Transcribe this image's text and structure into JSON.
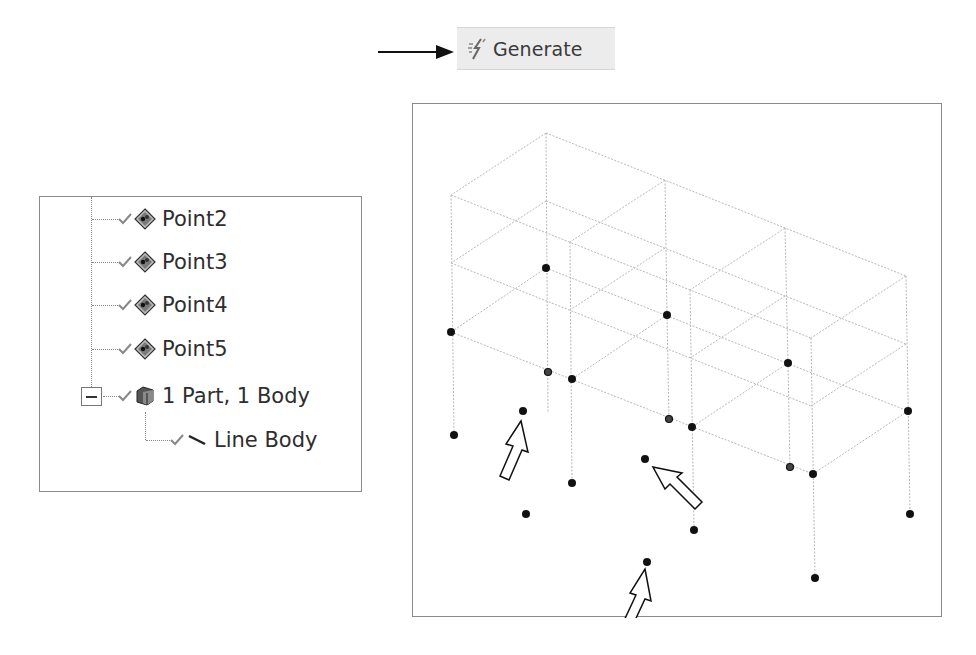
{
  "toolbar": {
    "generate_label": "Generate",
    "generate_icon": "generate-lightning-icon"
  },
  "annotation": {
    "pointer_arrow": "right-arrow-icon"
  },
  "tree": {
    "items": [
      {
        "label": "Point2",
        "icon": "point-feature-icon",
        "status": "check-icon"
      },
      {
        "label": "Point3",
        "icon": "point-feature-icon",
        "status": "check-icon"
      },
      {
        "label": "Point4",
        "icon": "point-feature-icon",
        "status": "check-icon"
      },
      {
        "label": "Point5",
        "icon": "point-feature-icon",
        "status": "check-icon"
      },
      {
        "label": "1 Part, 1 Body",
        "icon": "part-body-icon",
        "status": "check-icon",
        "expanded": true
      },
      {
        "label": "Line Body",
        "icon": "line-body-icon",
        "status": "check-icon"
      }
    ]
  },
  "viewport": {
    "description": "3D wireframe of line-body frame structure with points",
    "line_color": "#b8b8b8",
    "node_color": "#111111",
    "frame_levels": 3,
    "bays_x": 3,
    "bays_y": 1,
    "annotation_arrows": 3
  }
}
